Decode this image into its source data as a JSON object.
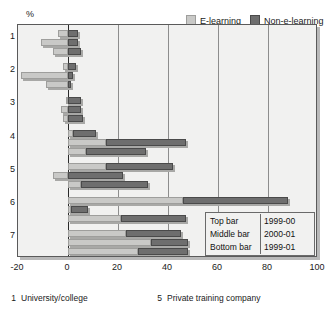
{
  "chart_data": {
    "type": "bar",
    "orientation": "horizontal",
    "stacked": true,
    "xlabel": "",
    "ylabel": "%",
    "axis_unit_label": "%",
    "xlim": [
      -20,
      100
    ],
    "xticks": [
      -20,
      0,
      20,
      40,
      60,
      80,
      100
    ],
    "xtick_labels": [
      "-20",
      "0",
      "20",
      "40",
      "60",
      "80",
      "100"
    ],
    "categories": [
      "1",
      "2",
      "3",
      "4",
      "5",
      "6",
      "7"
    ],
    "ycategories": [
      {
        "id": "1",
        "label": "1"
      },
      {
        "id": "2",
        "label": "2"
      },
      {
        "id": "3",
        "label": "3"
      },
      {
        "id": "4",
        "label": "4"
      },
      {
        "id": "5",
        "label": "5"
      },
      {
        "id": "6",
        "label": "6"
      },
      {
        "id": "7",
        "label": "7"
      }
    ],
    "grid": true,
    "grid_axis": "x",
    "legend_position": "top-right",
    "legend": [
      {
        "name": "E-learning",
        "color": "#c9c9c7"
      },
      {
        "name": "Non-e-learning",
        "color": "#6e6e6e"
      }
    ],
    "bar_order_key": [
      {
        "position": "Top bar",
        "period": "1999-00"
      },
      {
        "position": "Middle bar",
        "period": "2000-01"
      },
      {
        "position": "Bottom bar",
        "period": "1999-01"
      }
    ],
    "series": [
      {
        "name": "E-learning",
        "color": "#c9c9c7"
      },
      {
        "name": "Non-e-learning",
        "color": "#6e6e6e"
      }
    ],
    "groups": [
      {
        "category": "1",
        "bars": [
          {
            "period": "1999-00",
            "e_learning": -4,
            "non_e_learning": 4
          },
          {
            "period": "2000-01",
            "e_learning": -11,
            "non_e_learning": 4
          },
          {
            "period": "1999-01",
            "e_learning": -6,
            "non_e_learning": 5
          }
        ]
      },
      {
        "category": "2",
        "bars": [
          {
            "period": "1999-00",
            "e_learning": -2,
            "non_e_learning": 3
          },
          {
            "period": "2000-01",
            "e_learning": -19,
            "non_e_learning": 2
          },
          {
            "period": "1999-01",
            "e_learning": -9,
            "non_e_learning": 1
          }
        ]
      },
      {
        "category": "3",
        "bars": [
          {
            "period": "1999-00",
            "e_learning": -1,
            "non_e_learning": 5
          },
          {
            "period": "2000-01",
            "e_learning": -3,
            "non_e_learning": 5
          },
          {
            "period": "1999-01",
            "e_learning": -2,
            "non_e_learning": 6
          }
        ]
      },
      {
        "category": "4",
        "bars": [
          {
            "period": "1999-00",
            "e_learning": 2,
            "non_e_learning": 9
          },
          {
            "period": "2000-01",
            "e_learning": 15,
            "non_e_learning": 32
          },
          {
            "period": "1999-01",
            "e_learning": 7,
            "non_e_learning": 24
          }
        ]
      },
      {
        "category": "5",
        "bars": [
          {
            "period": "1999-00",
            "e_learning": 15,
            "non_e_learning": 27
          },
          {
            "period": "2000-01",
            "e_learning": -6,
            "non_e_learning": 22
          },
          {
            "period": "1999-01",
            "e_learning": 5,
            "non_e_learning": 27
          }
        ]
      },
      {
        "category": "6",
        "bars": [
          {
            "period": "1999-00",
            "e_learning": 46,
            "non_e_learning": 42
          },
          {
            "period": "2000-01",
            "e_learning": 1,
            "non_e_learning": 7
          },
          {
            "period": "1999-01",
            "e_learning": 21,
            "non_e_learning": 26
          }
        ]
      },
      {
        "category": "7",
        "bars": [
          {
            "period": "1999-00",
            "e_learning": 23,
            "non_e_learning": 22
          },
          {
            "period": "2000-01",
            "e_learning": 33,
            "non_e_learning": 15
          },
          {
            "period": "1999-01",
            "e_learning": 28,
            "non_e_learning": 20
          }
        ]
      }
    ],
    "annotations": {
      "key_box_rows": [
        {
          "label": "Top bar",
          "value": "1999-00"
        },
        {
          "label": "Middle bar",
          "value": "2000-01"
        },
        {
          "label": "Bottom bar",
          "value": "1999-01"
        }
      ]
    },
    "footnotes": [
      {
        "num": "1",
        "text": "University/college"
      },
      {
        "num": "5",
        "text": "Private training company"
      }
    ]
  },
  "legend": {
    "e_learning": "E-learning",
    "non_e_learning": "Non-e-learning"
  },
  "axis": {
    "y_unit": "%",
    "ytick_1": "1",
    "ytick_2": "2",
    "ytick_3": "3",
    "ytick_4": "4",
    "ytick_5": "5",
    "ytick_6": "6",
    "ytick_7": "7",
    "xtick_m20": "-20",
    "xtick_0": "0",
    "xtick_20": "20",
    "xtick_40": "40",
    "xtick_60": "60",
    "xtick_80": "80",
    "xtick_100": "100"
  },
  "keybox": {
    "row1_label": "Top bar",
    "row1_value": "1999-00",
    "row2_label": "Middle bar",
    "row2_value": "2000-01",
    "row3_label": "Bottom bar",
    "row3_value": "1999-01"
  },
  "footnotes": {
    "f1_num": "1",
    "f1_text": "University/college",
    "f5_num": "5",
    "f5_text": "Private training company"
  },
  "colors": {
    "e_learning": "#c9c9c7",
    "non_e_learning": "#6e6e6e",
    "plot_bg": "#f1f1f0",
    "grid": "#8d8d8d",
    "axis": "#2a2a2a"
  }
}
